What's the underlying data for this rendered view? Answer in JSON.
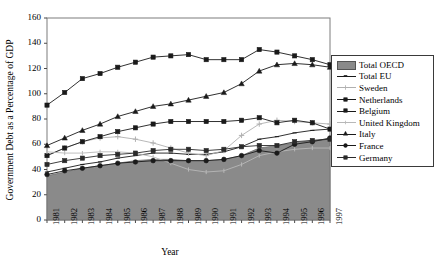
{
  "chart_data": {
    "type": "area",
    "title": "",
    "xlabel": "Year",
    "ylabel": "Government Debt as a Percentage of GDP",
    "categories": [
      1981,
      1982,
      1983,
      1984,
      1985,
      1986,
      1987,
      1988,
      1989,
      1990,
      1991,
      1992,
      1993,
      1994,
      1995,
      1996,
      1997
    ],
    "ylim": [
      0,
      160
    ],
    "yticks": [
      0,
      20,
      40,
      60,
      80,
      100,
      120,
      140,
      160
    ],
    "grid": false,
    "legend_position": "right",
    "series": [
      {
        "name": "Total OECD",
        "render": "area",
        "color": "#8a8a8a",
        "marker": "none",
        "values": [
          35,
          38,
          41,
          43,
          45,
          47,
          48,
          48,
          47,
          47,
          48,
          51,
          57,
          59,
          61,
          63,
          64
        ]
      },
      {
        "name": "Total EU",
        "render": "line",
        "color": "#1a1a1a",
        "marker": "dash",
        "values": [
          38,
          41,
          44,
          46,
          49,
          51,
          53,
          53,
          52,
          52,
          54,
          58,
          64,
          66,
          69,
          71,
          72
        ]
      },
      {
        "name": "Sweden",
        "render": "line",
        "color": "#b0b0b0",
        "marker": "plus",
        "values": [
          51,
          57,
          62,
          65,
          66,
          64,
          61,
          57,
          53,
          51,
          55,
          67,
          76,
          79,
          78,
          77,
          76
        ]
      },
      {
        "name": "Netherlands",
        "render": "line",
        "color": "#1a1a1a",
        "marker": "diamond",
        "values": [
          51,
          57,
          62,
          66,
          70,
          73,
          76,
          78,
          78,
          78,
          78,
          79,
          81,
          77,
          79,
          77,
          72
        ]
      },
      {
        "name": "Belgium",
        "render": "line",
        "color": "#1a1a1a",
        "marker": "square",
        "values": [
          91,
          101,
          112,
          116,
          121,
          125,
          129,
          130,
          131,
          127,
          127,
          127,
          135,
          133,
          130,
          127,
          123
        ]
      },
      {
        "name": "United Kingdom",
        "render": "line",
        "color": "#b8b8b8",
        "marker": "tick",
        "values": [
          54,
          53,
          53,
          54,
          54,
          53,
          50,
          45,
          40,
          38,
          39,
          44,
          51,
          54,
          56,
          57,
          57
        ]
      },
      {
        "name": "Italy",
        "render": "line",
        "color": "#1a1a1a",
        "marker": "triangle",
        "values": [
          59,
          65,
          71,
          76,
          82,
          86,
          90,
          92,
          95,
          98,
          101,
          108,
          118,
          123,
          124,
          123,
          121
        ]
      },
      {
        "name": "France",
        "render": "line",
        "color": "#1a1a1a",
        "marker": "circle",
        "values": [
          36,
          39,
          41,
          43,
          45,
          46,
          47,
          47,
          47,
          47,
          48,
          51,
          55,
          53,
          60,
          62,
          65
        ]
      },
      {
        "name": "Germany",
        "render": "line",
        "color": "#2a2a2a",
        "marker": "circle-filled",
        "values": [
          44,
          47,
          49,
          51,
          52,
          53,
          55,
          56,
          56,
          55,
          56,
          58,
          59,
          59,
          62,
          63,
          64
        ]
      }
    ]
  },
  "legend": {
    "items": [
      {
        "label": "Total OECD",
        "key": "swatch"
      },
      {
        "label": "Total EU",
        "key": "line-dash"
      },
      {
        "label": "Sweden",
        "key": "line-plus"
      },
      {
        "label": "Netherlands",
        "key": "line-diamond"
      },
      {
        "label": "Belgium",
        "key": "line-square"
      },
      {
        "label": "United Kingdom",
        "key": "line-tick"
      },
      {
        "label": "Italy",
        "key": "line-triangle"
      },
      {
        "label": "France",
        "key": "line-circle"
      },
      {
        "label": "Germany",
        "key": "line-circle-filled"
      }
    ]
  },
  "axes": {
    "y_title": "Government Debt as a Percentage of GDP",
    "x_title": "Year"
  }
}
